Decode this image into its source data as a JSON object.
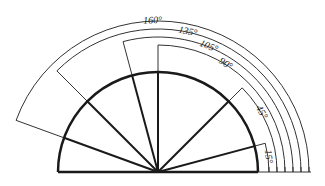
{
  "diagram": {
    "center": [
      158,
      172
    ],
    "inner_radius": 100,
    "radial_line_angles_deg": [
      15,
      45,
      90,
      105,
      135,
      160
    ],
    "dimensions": [
      {
        "angle": 15,
        "label": "15°",
        "radius": 111
      },
      {
        "angle": 45,
        "label": "45°",
        "radius": 119
      },
      {
        "angle": 90,
        "label": "90°",
        "radius": 127
      },
      {
        "angle": 105,
        "label": "105°",
        "radius": 135
      },
      {
        "angle": 135,
        "label": "135°",
        "radius": 143
      },
      {
        "angle": 160,
        "label": "160°",
        "radius": 151
      }
    ],
    "colors": {
      "stroke": "#1a1a1a",
      "thin": "#333333",
      "background": "#ffffff"
    }
  }
}
